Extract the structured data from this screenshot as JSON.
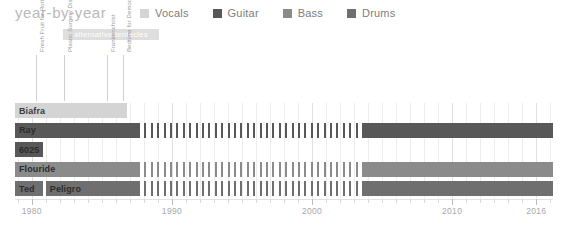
{
  "header": {
    "title": "year-by-year"
  },
  "legend": {
    "position": "top-right",
    "items": [
      {
        "label": "Vocals",
        "color": "#d4d4d4",
        "name": "vocals"
      },
      {
        "label": "Guitar",
        "color": "#585858",
        "name": "guitar"
      },
      {
        "label": "Bass",
        "color": "#8b8b8b",
        "name": "bass"
      },
      {
        "label": "Drums",
        "color": "#6f6f6f",
        "name": "drums"
      }
    ]
  },
  "label_bands": [
    {
      "text": "alternative tentacles",
      "start": 1982.2,
      "end": 1989.1,
      "color": "#dedede",
      "text_color": "#ffffff"
    }
  ],
  "albums": [
    {
      "title": "Fresh Fruit for Rotting Vegetables",
      "year": 1980.3
    },
    {
      "title": "Plastic Surgery Disasters",
      "year": 1982.3
    },
    {
      "title": "Frankenchrist",
      "year": 1985.4
    },
    {
      "title": "Bedtime for Democracy",
      "year": 1986.5
    }
  ],
  "chart_data": {
    "type": "bar",
    "subtype": "gantt-timeline",
    "title": "year-by-year",
    "xlabel": "",
    "ylabel": "",
    "xlim": [
      1978.8,
      2017.2
    ],
    "xticks": [
      1980,
      1990,
      2000,
      2010,
      2016
    ],
    "xticklabels": [
      "1980",
      "1990",
      "2000",
      "2010",
      "2016"
    ],
    "minor_tick_step": 1,
    "grid": true,
    "legend_position": "top-right",
    "categories": [
      "Biafra",
      "Ray",
      "6025",
      "Flouride",
      "Ted / Peligro"
    ],
    "rows": [
      {
        "name": "Biafra",
        "role": "Vocals",
        "color": "#d4d4d4",
        "segments": [
          {
            "label": "Biafra",
            "start": 1978.8,
            "end": 1986.8,
            "style": "solid"
          }
        ]
      },
      {
        "name": "Ray",
        "role": "Guitar",
        "color": "#585858",
        "segments": [
          {
            "label": "Ray",
            "start": 1978.8,
            "end": 1987.6,
            "style": "solid"
          },
          {
            "label": "",
            "start": 1987.6,
            "end": 2003.6,
            "style": "striped"
          },
          {
            "label": "",
            "start": 2003.6,
            "end": 2017.2,
            "style": "solid"
          }
        ]
      },
      {
        "name": "6025",
        "role": "Guitar",
        "color": "#585858",
        "segments": [
          {
            "label": "6025",
            "start": 1978.8,
            "end": 1980.8,
            "style": "solid"
          }
        ]
      },
      {
        "name": "Flouride",
        "role": "Bass",
        "color": "#8b8b8b",
        "segments": [
          {
            "label": "Flouride",
            "start": 1978.8,
            "end": 1987.6,
            "style": "solid"
          },
          {
            "label": "",
            "start": 1987.6,
            "end": 2003.6,
            "style": "striped"
          },
          {
            "label": "",
            "start": 2003.6,
            "end": 2017.2,
            "style": "solid"
          }
        ]
      },
      {
        "name": "Ted / Peligro",
        "role": "Drums",
        "color": "#6f6f6f",
        "segments": [
          {
            "label": "Ted",
            "start": 1978.8,
            "end": 1980.8,
            "style": "solid"
          },
          {
            "label": "Peligro",
            "start": 1981.0,
            "end": 1987.6,
            "style": "solid"
          },
          {
            "label": "",
            "start": 1987.6,
            "end": 2003.6,
            "style": "striped"
          },
          {
            "label": "",
            "start": 2003.6,
            "end": 2017.2,
            "style": "solid"
          }
        ]
      }
    ]
  }
}
